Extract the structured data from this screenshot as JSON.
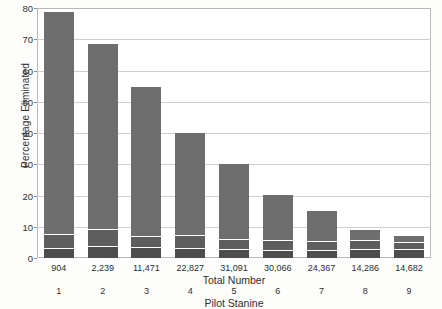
{
  "chart_data": {
    "type": "bar",
    "subtype": "stacked-bar",
    "title": "",
    "xlabel": "Pilot Stanine",
    "secondary_xlabel": "Total Number",
    "ylabel": "Percentage Eliminated",
    "ylim": [
      0,
      80
    ],
    "yticks": [
      0,
      10,
      20,
      30,
      40,
      50,
      60,
      70,
      80
    ],
    "ytick_labels": [
      "0",
      "10",
      "20",
      "30",
      "40",
      "50",
      "60",
      "70",
      "80"
    ],
    "grid": true,
    "legend": "none",
    "categories": [
      "1",
      "2",
      "3",
      "4",
      "5",
      "6",
      "7",
      "8",
      "9"
    ],
    "secondary_categories": [
      "904",
      "2,239",
      "11,471",
      "22,827",
      "31,091",
      "30,066",
      "24,367",
      "14,286",
      "14,682"
    ],
    "series": [
      {
        "name": "bottom",
        "color": "#4d4d4d",
        "values": [
          3.0,
          3.4,
          3.2,
          3.0,
          2.6,
          2.4,
          2.4,
          2.6,
          2.6
        ]
      },
      {
        "name": "middle",
        "color": "#5e5e5e",
        "values": [
          3.9,
          5.1,
          3.1,
          3.8,
          2.8,
          2.6,
          2.5,
          2.4,
          1.9
        ]
      },
      {
        "name": "top",
        "color": "#6e6e6e",
        "values": [
          71.1,
          59.5,
          47.7,
          32.7,
          24.1,
          14.6,
          9.6,
          3.3,
          1.8
        ]
      }
    ],
    "totals": [
      78.0,
      68.0,
      54.0,
      39.5,
      29.5,
      19.6,
      14.5,
      8.3,
      6.3
    ]
  },
  "axes": {
    "y_title": "Percentage Eliminated",
    "x_title": "Pilot Stanine",
    "x_secondary_title": "Total Number"
  }
}
